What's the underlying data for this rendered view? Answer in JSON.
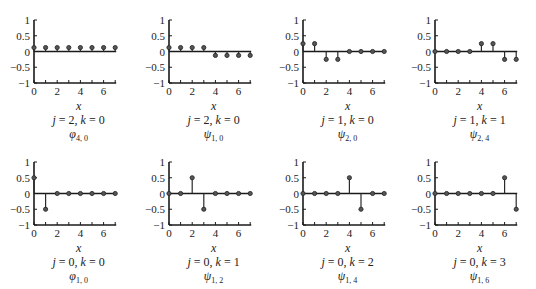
{
  "figure": {
    "layout": {
      "rows": 2,
      "cols": 4
    },
    "colors": {
      "stem": "#2a2a2a",
      "axis": "#1a1a1a",
      "text": "#222222"
    }
  },
  "chart_data": [
    {
      "type": "stem",
      "xlabel": "x",
      "caption": "j = 2, k = 0",
      "function_label": "φ",
      "function_sub": "4, 0",
      "x": [
        0,
        1,
        2,
        3,
        4,
        5,
        6,
        7
      ],
      "values": [
        0.125,
        0.125,
        0.125,
        0.125,
        0.125,
        0.125,
        0.125,
        0.125
      ],
      "ylim": [
        -1,
        1
      ],
      "xlim": [
        0,
        7
      ],
      "yticks": [
        "1",
        "0.5",
        "0",
        "−0.5",
        "−1"
      ],
      "xticks": [
        "0",
        "2",
        "4",
        "6"
      ]
    },
    {
      "type": "stem",
      "xlabel": "x",
      "caption": "j = 2, k = 0",
      "function_label": "ψ",
      "function_sub": "1, 0",
      "x": [
        0,
        1,
        2,
        3,
        4,
        5,
        6,
        7
      ],
      "values": [
        0.125,
        0.125,
        0.125,
        0.125,
        -0.125,
        -0.125,
        -0.125,
        -0.125
      ],
      "ylim": [
        -1,
        1
      ],
      "xlim": [
        0,
        7
      ],
      "yticks": [
        "1",
        "0.5",
        "0",
        "−0.5",
        "−1"
      ],
      "xticks": [
        "0",
        "2",
        "4",
        "6"
      ]
    },
    {
      "type": "stem",
      "xlabel": "x",
      "caption": "j = 1, k = 0",
      "function_label": "ψ",
      "function_sub": "2, 0",
      "x": [
        0,
        1,
        2,
        3,
        4,
        5,
        6,
        7
      ],
      "values": [
        0.25,
        0.25,
        -0.25,
        -0.25,
        0,
        0,
        0,
        0
      ],
      "ylim": [
        -1,
        1
      ],
      "xlim": [
        0,
        7
      ],
      "yticks": [
        "1",
        "0.5",
        "0",
        "−0.5",
        "−1"
      ],
      "xticks": [
        "0",
        "2",
        "4",
        "6"
      ]
    },
    {
      "type": "stem",
      "xlabel": "x",
      "caption": "j = 1, k = 1",
      "function_label": "ψ",
      "function_sub": "2, 4",
      "x": [
        0,
        1,
        2,
        3,
        4,
        5,
        6,
        7
      ],
      "values": [
        0,
        0,
        0,
        0,
        0.25,
        0.25,
        -0.25,
        -0.25
      ],
      "ylim": [
        -1,
        1
      ],
      "xlim": [
        0,
        7
      ],
      "yticks": [
        "1",
        "0.5",
        "0",
        "−0.5",
        "−1"
      ],
      "xticks": [
        "0",
        "2",
        "4",
        "6"
      ]
    },
    {
      "type": "stem",
      "xlabel": "x",
      "caption": "j = 0, k = 0",
      "function_label": "φ",
      "function_sub": "1, 0",
      "x": [
        0,
        1,
        2,
        3,
        4,
        5,
        6,
        7
      ],
      "values": [
        0.5,
        -0.5,
        0,
        0,
        0,
        0,
        0,
        0
      ],
      "ylim": [
        -1,
        1
      ],
      "xlim": [
        0,
        7
      ],
      "yticks": [
        "1",
        "0.5",
        "0",
        "−0.5",
        "−1"
      ],
      "xticks": [
        "0",
        "2",
        "4",
        "6"
      ]
    },
    {
      "type": "stem",
      "xlabel": "x",
      "caption": "j = 0, k = 1",
      "function_label": "ψ",
      "function_sub": "1, 2",
      "x": [
        0,
        1,
        2,
        3,
        4,
        5,
        6,
        7
      ],
      "values": [
        0,
        0,
        0.5,
        -0.5,
        0,
        0,
        0,
        0
      ],
      "ylim": [
        -1,
        1
      ],
      "xlim": [
        0,
        7
      ],
      "yticks": [
        "1",
        "0.5",
        "0",
        "−0.5",
        "−1"
      ],
      "xticks": [
        "0",
        "2",
        "4",
        "6"
      ]
    },
    {
      "type": "stem",
      "xlabel": "x",
      "caption": "j = 0, k = 2",
      "function_label": "ψ",
      "function_sub": "1, 4",
      "x": [
        0,
        1,
        2,
        3,
        4,
        5,
        6,
        7
      ],
      "values": [
        0,
        0,
        0,
        0,
        0.5,
        -0.5,
        0,
        0
      ],
      "ylim": [
        -1,
        1
      ],
      "xlim": [
        0,
        7
      ],
      "yticks": [
        "1",
        "0.5",
        "0",
        "−0.5",
        "−1"
      ],
      "xticks": [
        "0",
        "2",
        "4",
        "6"
      ]
    },
    {
      "type": "stem",
      "xlabel": "x",
      "caption": "j = 0, k = 3",
      "function_label": "ψ",
      "function_sub": "1, 6",
      "x": [
        0,
        1,
        2,
        3,
        4,
        5,
        6,
        7
      ],
      "values": [
        0,
        0,
        0,
        0,
        0,
        0,
        0.5,
        -0.5
      ],
      "ylim": [
        -1,
        1
      ],
      "xlim": [
        0,
        7
      ],
      "yticks": [
        "1",
        "0.5",
        "0",
        "−0.5",
        "−1"
      ],
      "xticks": [
        "0",
        "2",
        "4",
        "6"
      ]
    }
  ]
}
